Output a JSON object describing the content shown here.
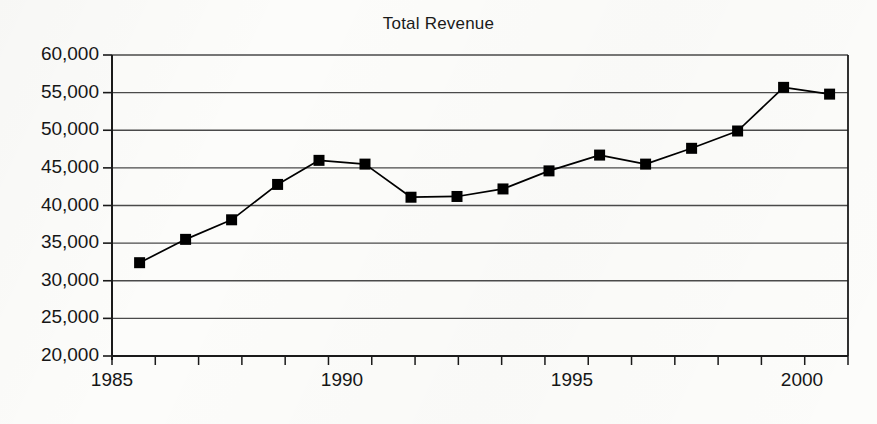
{
  "chart_data": {
    "type": "line",
    "title": "Total Revenue",
    "xlabel": "",
    "ylabel": "",
    "xlim": [
      1985,
      2001
    ],
    "ylim": [
      20000,
      60000
    ],
    "grid": "horizontal",
    "legend": "none",
    "marker": "filled-square",
    "line_color": "#000000",
    "marker_color": "#000000",
    "grid_color": "#4a4a4a",
    "axis_color": "#1a1a1a",
    "y_ticks": [
      20000,
      25000,
      30000,
      35000,
      40000,
      45000,
      50000,
      55000,
      60000
    ],
    "y_tick_labels": [
      "20,000",
      "25,000",
      "30,000",
      "35,000",
      "40,000",
      "45,000",
      "50,000",
      "55,000",
      "60,000"
    ],
    "x_ticks": [
      1985,
      1990,
      1995,
      2000
    ],
    "x_tick_labels": [
      "1985",
      "1990",
      "1995",
      "2000"
    ],
    "x_minor_tick_count": 17,
    "x": [
      1985.6,
      1986.6,
      1987.6,
      1988.6,
      1989.5,
      1990.5,
      1991.5,
      1992.5,
      1993.5,
      1994.5,
      1995.6,
      1996.6,
      1997.6,
      1998.6,
      1999.6,
      2000.6
    ],
    "values": [
      32400,
      35500,
      38100,
      42800,
      46000,
      45500,
      41100,
      41200,
      42200,
      44600,
      46700,
      45500,
      47600,
      49900,
      55700,
      54800
    ],
    "series": [
      {
        "name": "Total Revenue",
        "values": [
          32400,
          35500,
          38100,
          42800,
          46000,
          45500,
          41100,
          41200,
          42200,
          44600,
          46700,
          45500,
          47600,
          49900,
          55700,
          54800
        ]
      }
    ]
  },
  "plot_geometry": {
    "left": 112,
    "right": 848,
    "top": 55,
    "bottom": 356
  }
}
